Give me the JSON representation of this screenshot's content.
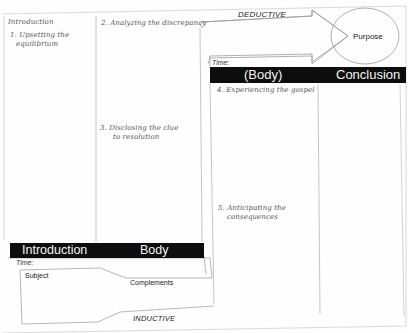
{
  "diagram": {
    "top_labels": {
      "deductive": "DEDUCTIVE",
      "purpose": "Purpose"
    },
    "bottom_labels": {
      "inductive": "INDUCTIVE",
      "subject": "Subject",
      "complements": "Complements"
    },
    "bottom_bar": {
      "introduction": "Introduction",
      "body": "Body",
      "time_label": "Time:"
    },
    "top_bar": {
      "body": "(Body)",
      "conclusion": "Conclusion",
      "time_label": "Time:"
    },
    "handwritten": {
      "intro_heading": "Introduction",
      "step1_line1": "1. Upsetting the",
      "step1_line2": "equilibrium",
      "step2": "2. Analyzing the discrepancy",
      "step3_line1": "3. Disclosing the clue",
      "step3_line2": "to resolution",
      "step4": "4. Experiencing the gospel",
      "step5_line1": "5. Anticipating the",
      "step5_line2": "consequences"
    }
  }
}
